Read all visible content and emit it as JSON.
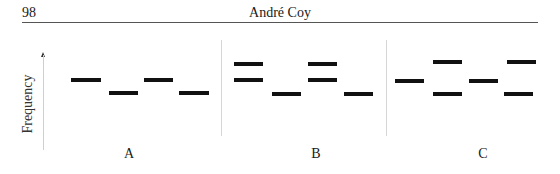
{
  "header": {
    "page_number": "98",
    "running_title": "André Coy"
  },
  "figure": {
    "y_axis_label": "Frequency",
    "panels": [
      {
        "label": "A",
        "label_x": 129
      },
      {
        "label": "B",
        "label_x": 316
      },
      {
        "label": "C",
        "label_x": 483
      }
    ],
    "dividers_x": [
      221,
      386
    ],
    "bars": [
      {
        "panel": "A",
        "x": 71,
        "y": 78,
        "w": 30
      },
      {
        "panel": "A",
        "x": 109,
        "y": 91,
        "w": 29
      },
      {
        "panel": "A",
        "x": 144,
        "y": 78,
        "w": 29
      },
      {
        "panel": "A",
        "x": 179,
        "y": 91,
        "w": 30
      },
      {
        "panel": "B",
        "x": 234,
        "y": 62,
        "w": 29
      },
      {
        "panel": "B",
        "x": 234,
        "y": 78,
        "w": 29
      },
      {
        "panel": "B",
        "x": 272,
        "y": 92,
        "w": 29
      },
      {
        "panel": "B",
        "x": 308,
        "y": 62,
        "w": 29
      },
      {
        "panel": "B",
        "x": 308,
        "y": 78,
        "w": 29
      },
      {
        "panel": "B",
        "x": 344,
        "y": 92,
        "w": 29
      },
      {
        "panel": "C",
        "x": 395,
        "y": 79,
        "w": 29
      },
      {
        "panel": "C",
        "x": 433,
        "y": 60,
        "w": 29
      },
      {
        "panel": "C",
        "x": 433,
        "y": 92,
        "w": 29
      },
      {
        "panel": "C",
        "x": 469,
        "y": 79,
        "w": 29
      },
      {
        "panel": "C",
        "x": 507,
        "y": 60,
        "w": 29
      },
      {
        "panel": "C",
        "x": 504,
        "y": 92,
        "w": 29
      }
    ]
  },
  "chart_data": {
    "type": "schematic-frequency-bars",
    "ylabel": "Frequency",
    "xlabel": "",
    "panels": [
      {
        "name": "A",
        "segments": [
          [
            "mid"
          ],
          [
            "low"
          ],
          [
            "mid"
          ],
          [
            "low"
          ]
        ]
      },
      {
        "name": "B",
        "segments": [
          [
            "high",
            "mid"
          ],
          [
            "low"
          ],
          [
            "high",
            "mid"
          ],
          [
            "low"
          ]
        ]
      },
      {
        "name": "C",
        "segments": [
          [
            "mid"
          ],
          [
            "high",
            "low"
          ],
          [
            "mid"
          ],
          [
            "high",
            "low"
          ]
        ]
      }
    ]
  }
}
